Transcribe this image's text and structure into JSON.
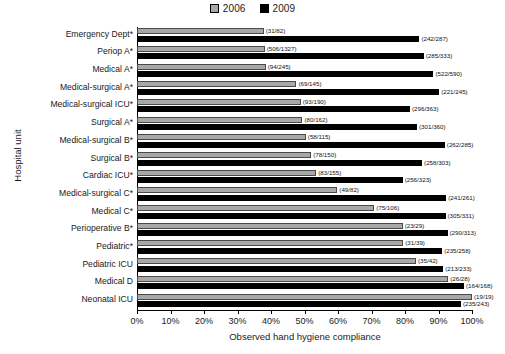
{
  "chart_data": {
    "type": "bar",
    "orientation": "horizontal",
    "title": "",
    "xlabel": "Observed hand hygiene compliance",
    "ylabel": "Hospital unit",
    "xlim": [
      0,
      100
    ],
    "xticks": [
      "0%",
      "10%",
      "20%",
      "30%",
      "40%",
      "50%",
      "60%",
      "70%",
      "80%",
      "90%",
      "100%"
    ],
    "xtick_values": [
      0,
      10,
      20,
      30,
      40,
      50,
      60,
      70,
      80,
      90,
      100
    ],
    "grid": false,
    "legend_position": "top-center",
    "legend": [
      "2006",
      "2009"
    ],
    "categories": [
      "Emergency Dept*",
      "Periop A*",
      "Medical A*",
      "Medical-surgical A*",
      "Medical-surgical ICU*",
      "Surgical A*",
      "Medical-surgical B*",
      "Surgical B*",
      "Cardiac ICU*",
      "Medical-surgical C*",
      "Medical C*",
      "Perioperative B*",
      "Pediatric*",
      "Pediatric ICU",
      "Medical D",
      "Neonatal ICU"
    ],
    "series": [
      {
        "name": "2006",
        "color": "#a8a8a8",
        "values": [
          37.8,
          38.1,
          38.4,
          47.6,
          48.9,
          49.4,
          50.4,
          52.0,
          53.5,
          59.8,
          70.8,
          79.3,
          79.5,
          83.3,
          92.9,
          100.0
        ],
        "labels": [
          "(31/82)",
          "(506/1327)",
          "(94/245)",
          "(69/145)",
          "(93/190)",
          "(80/162)",
          "(58/115)",
          "(78/150)",
          "(83/155)",
          "(49/82)",
          "(75/106)",
          "(23/29)",
          "(31/39)",
          "(35/42)",
          "(26/28)",
          "(19/19)"
        ],
        "numerators": [
          31,
          506,
          94,
          69,
          93,
          80,
          58,
          78,
          83,
          49,
          75,
          23,
          31,
          35,
          26,
          19
        ],
        "denominators": [
          82,
          1327,
          245,
          145,
          190,
          162,
          115,
          150,
          155,
          82,
          106,
          29,
          39,
          42,
          28,
          19
        ]
      },
      {
        "name": "2009",
        "color": "#000000",
        "values": [
          84.3,
          85.6,
          88.5,
          90.2,
          81.5,
          83.6,
          91.9,
          85.1,
          79.3,
          92.3,
          92.1,
          92.7,
          91.1,
          91.4,
          97.6,
          96.7
        ],
        "labels": [
          "(242/287)",
          "(285/333)",
          "(522/590)",
          "(221/245)",
          "(296/363)",
          "(301/360)",
          "(262/285)",
          "(258/303)",
          "(256/323)",
          "(241/261)",
          "(305/331)",
          "(290/313)",
          "(235/258)",
          "(213/233)",
          "(164/168)",
          "(235/243)"
        ],
        "numerators": [
          242,
          285,
          522,
          221,
          296,
          301,
          262,
          258,
          256,
          241,
          305,
          290,
          235,
          213,
          164,
          235
        ],
        "denominators": [
          287,
          333,
          590,
          245,
          363,
          360,
          285,
          303,
          323,
          261,
          331,
          313,
          258,
          233,
          168,
          243
        ]
      }
    ]
  }
}
